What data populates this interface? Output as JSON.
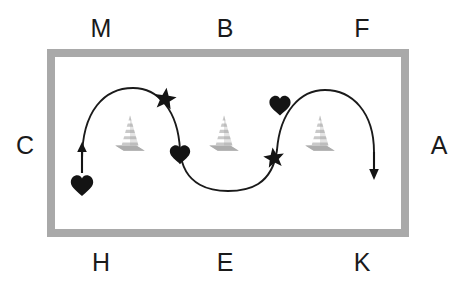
{
  "diagram": {
    "arena": {
      "border_color": "#a9a9a9",
      "fill_color": "#ffffff",
      "border_width_px": 8,
      "x": 47,
      "y": 49,
      "width": 362,
      "height": 188
    },
    "letters": [
      {
        "id": "M",
        "label": "M",
        "side": "top",
        "x": 101,
        "y": 28
      },
      {
        "id": "B",
        "label": "B",
        "side": "top",
        "x": 225,
        "y": 28
      },
      {
        "id": "F",
        "label": "F",
        "side": "top",
        "x": 362,
        "y": 28
      },
      {
        "id": "C",
        "label": "C",
        "side": "left",
        "x": 25,
        "y": 145
      },
      {
        "id": "A",
        "label": "A",
        "side": "right",
        "x": 439,
        "y": 145
      },
      {
        "id": "H",
        "label": "H",
        "side": "bottom",
        "x": 101,
        "y": 262
      },
      {
        "id": "E",
        "label": "E",
        "side": "bottom",
        "x": 225,
        "y": 262
      },
      {
        "id": "K",
        "label": "K",
        "side": "bottom",
        "x": 362,
        "y": 262
      }
    ],
    "cones": [
      {
        "id": "cone-left",
        "x": 130,
        "y": 133,
        "color": "#bdbdbd"
      },
      {
        "id": "cone-middle",
        "x": 224,
        "y": 133,
        "color": "#bdbdbd"
      },
      {
        "id": "cone-right",
        "x": 320,
        "y": 133,
        "color": "#bdbdbd"
      }
    ],
    "path": {
      "stroke_color": "#1a1a1a",
      "stroke_width": 1.9,
      "description": "serpentine: up-left loop over first cone, down through valley, up over third cone, exit down at right",
      "d": "M 82 160 C 82 110, 105 88, 133 88 C 158 88, 178 110, 180 150 C 183 188, 214 191, 228 191 C 248 191, 272 186, 277 150 C 280 112, 300 90, 325 90 C 352 90, 374 112, 374 152"
    },
    "markers": [
      {
        "id": "start-heart",
        "type": "heart",
        "x": 82,
        "y": 185,
        "size": 22,
        "color": "#141414"
      },
      {
        "id": "star-1",
        "type": "star",
        "x": 165,
        "y": 99,
        "size": 22,
        "color": "#141414"
      },
      {
        "id": "heart-2",
        "type": "heart",
        "x": 180,
        "y": 155,
        "size": 20,
        "color": "#141414"
      },
      {
        "id": "star-2",
        "type": "star",
        "x": 274,
        "y": 158,
        "size": 20,
        "color": "#141414"
      },
      {
        "id": "heart-3",
        "type": "heart",
        "x": 280,
        "y": 106,
        "size": 21,
        "color": "#141414"
      }
    ],
    "arrows": [
      {
        "id": "start-arrow-up",
        "direction": "up",
        "x": 82,
        "y_tail": 172,
        "y_head": 144,
        "color": "#141414"
      },
      {
        "id": "end-arrow-down",
        "direction": "down",
        "x": 374,
        "y_tail": 150,
        "y_head": 178,
        "color": "#141414"
      }
    ]
  }
}
